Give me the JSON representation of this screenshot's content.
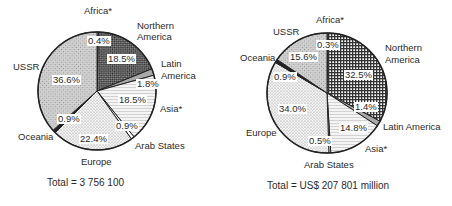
{
  "chart_data": [
    {
      "type": "pie",
      "title": "",
      "total_label": "Total = 3 756 100",
      "start_angle_deg": 0,
      "direction": "clockwise",
      "slices": [
        {
          "name": "Africa*",
          "value": 0.4,
          "label": "0.4%",
          "pattern": "vlines"
        },
        {
          "name": "Northern America",
          "value": 18.5,
          "label": "18.5%",
          "pattern": "check-dark"
        },
        {
          "name": "Latin America",
          "value": 1.8,
          "label": "1.8%",
          "pattern": "gray"
        },
        {
          "name": "Asia*",
          "value": 18.5,
          "label": "18.5%",
          "pattern": "hlines-light"
        },
        {
          "name": "Arab States",
          "value": 0.9,
          "label": "0.9%",
          "pattern": "white"
        },
        {
          "name": "Europe",
          "value": 22.4,
          "label": "22.4%",
          "pattern": "dots-light"
        },
        {
          "name": "Oceania",
          "value": 0.9,
          "label": "0.9%",
          "pattern": "black"
        },
        {
          "name": "USSR",
          "value": 36.6,
          "label": "36.6%",
          "pattern": "diag-mid"
        }
      ]
    },
    {
      "type": "pie",
      "title": "",
      "total_label": "Total = US$ 207 801 million",
      "start_angle_deg": 0,
      "direction": "clockwise",
      "slices": [
        {
          "name": "Africa*",
          "value": 0.3,
          "label": "0.3%",
          "pattern": "vlines"
        },
        {
          "name": "Northern America",
          "value": 32.5,
          "label": "32.5%",
          "pattern": "grid-dark"
        },
        {
          "name": "Latin America",
          "value": 1.4,
          "label": "1.4%",
          "pattern": "gray"
        },
        {
          "name": "Asia*",
          "value": 14.8,
          "label": "14.8%",
          "pattern": "hlines-light"
        },
        {
          "name": "Arab States",
          "value": 0.5,
          "label": "0.5%",
          "pattern": "white"
        },
        {
          "name": "Europe",
          "value": 34.0,
          "label": "34.0%",
          "pattern": "dots-light"
        },
        {
          "name": "Oceania",
          "value": 0.9,
          "label": "0.9%",
          "pattern": "black"
        },
        {
          "name": "USSR",
          "value": 15.6,
          "label": "15.6%",
          "pattern": "diag-mid"
        }
      ]
    }
  ],
  "left": {
    "total": "Total = 3 756 100",
    "labels": {
      "africa": "Africa*",
      "northern_america_1": "Northern",
      "northern_america_2": "America",
      "latin_america_1": "Latin",
      "latin_america_2": "America",
      "asia": "Asia*",
      "arab_states": "Arab States",
      "europe": "Europe",
      "oceania": "Oceania",
      "ussr": "USSR"
    },
    "pcts": {
      "africa": "0.4%",
      "northern_america": "18.5%",
      "latin_america": "1.8%",
      "asia": "18.5%",
      "arab_states": "0.9%",
      "europe": "22.4%",
      "oceania": "0.9%",
      "ussr": "36.6%"
    }
  },
  "right": {
    "total": "Total = US$ 207 801 million",
    "labels": {
      "africa": "Africa*",
      "northern_america_1": "Northern",
      "northern_america_2": "America",
      "latin_america": "Latin America",
      "asia": "Asia*",
      "arab_states": "Arab States",
      "europe": "Europe",
      "oceania": "Oceania",
      "ussr": "USSR"
    },
    "pcts": {
      "africa": "0.3%",
      "northern_america": "32.5%",
      "latin_america": "1.4%",
      "asia": "14.8%",
      "arab_states": "0.5%",
      "europe": "34.0%",
      "oceania": "0.9%",
      "ussr": "15.6%"
    }
  },
  "geometry": {
    "left": {
      "cx": 97,
      "cy": 91,
      "r": 59
    },
    "right": {
      "cx": 101,
      "cy": 93,
      "r": 60
    }
  }
}
